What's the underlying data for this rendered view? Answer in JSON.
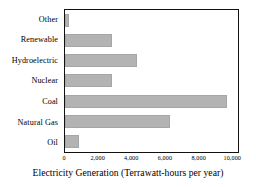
{
  "chart_data": {
    "type": "bar",
    "orientation": "horizontal",
    "title": "",
    "xlabel": "Electricity Generation (Terrawatt-hours per year)",
    "ylabel": "",
    "categories": [
      "Other",
      "Renewable",
      "Hydroelectric",
      "Nuclear",
      "Coal",
      "Natural Gas",
      "Oil"
    ],
    "values": [
      250,
      2850,
      4350,
      2850,
      9760,
      6300,
      830
    ],
    "xlim": [
      0,
      10400
    ],
    "ylim": null,
    "xticks": [
      0,
      2000,
      4000,
      6000,
      8000,
      10000
    ],
    "xtick_labels": [
      "0",
      "2,000",
      "4,000",
      "6,000",
      "8,000",
      "10,000"
    ],
    "grid": false,
    "legend": null,
    "bar_color": "#b3b3b3",
    "bar_edge_color": "#a6a6a6",
    "frame_color": "#111111",
    "background": "#ffffff"
  }
}
